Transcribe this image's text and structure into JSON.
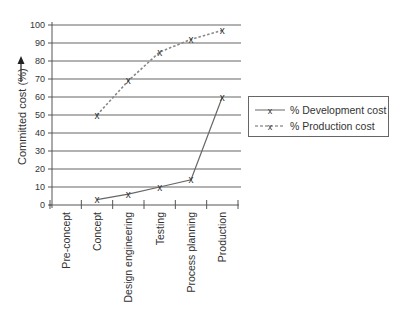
{
  "chart_data": {
    "type": "line",
    "title": "",
    "xlabel": "",
    "ylabel": "Committed cost (%)",
    "ylim": [
      0,
      100
    ],
    "yticks": [
      0,
      10,
      20,
      30,
      40,
      50,
      60,
      70,
      80,
      90,
      100
    ],
    "grid": true,
    "legend_position": "right",
    "categories": [
      "Pre-concept",
      "Concept",
      "Design engineering",
      "Testing",
      "Process planning",
      "Production"
    ],
    "series": [
      {
        "name": "% Development cost",
        "style": "solid",
        "marker": "x",
        "values": [
          null,
          3,
          6,
          10,
          14,
          60
        ]
      },
      {
        "name": "% Production cost",
        "style": "dashed",
        "marker": "x",
        "values": [
          null,
          50,
          69,
          85,
          92,
          97
        ]
      }
    ],
    "annotations": [
      "upward arrow beside y-axis label"
    ]
  },
  "legend": {
    "items": [
      {
        "label": "% Development cost",
        "style": "solid"
      },
      {
        "label": "% Production cost",
        "style": "dashed"
      }
    ]
  },
  "colors": {
    "line": "#666666",
    "grid": "#666666",
    "text": "#333333"
  }
}
